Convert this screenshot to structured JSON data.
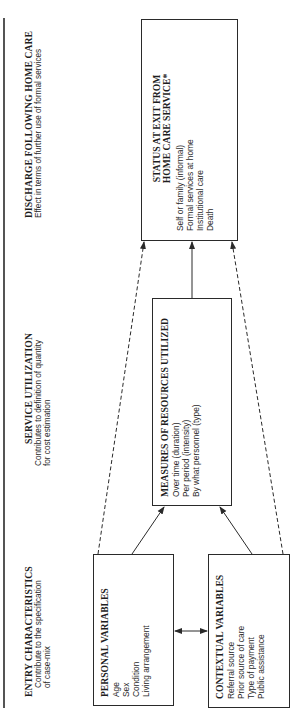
{
  "headers": {
    "entry": {
      "title": "ENTRY CHARACTERISTICS",
      "subtitle_lines": [
        "Contribute to the specification",
        "of case-mix"
      ]
    },
    "service": {
      "title": "SERVICE UTILIZATION",
      "subtitle_lines": [
        "Contributes to definition of quantity",
        "for cost estimation"
      ]
    },
    "discharge": {
      "title": "DISCHARGE FOLLOWING HOME CARE",
      "subtitle_lines": [
        "Effect in terms of further use of formal services"
      ]
    }
  },
  "boxes": {
    "personal": {
      "title": "PERSONAL VARIABLES",
      "items": [
        "Age",
        "Sex",
        "Condition",
        "Living arrangement"
      ]
    },
    "contextual": {
      "title": "CONTEXTUAL VARIABLES",
      "items": [
        "Referral source",
        "Prior source of care",
        "Type of payment",
        "Public assistance"
      ]
    },
    "measures": {
      "title": "MEASURES OF RESOURCES UTILIZED",
      "items": [
        "Over time (duration)",
        "Per period (intensity)",
        "By what personnel (type)"
      ]
    },
    "status": {
      "title_lines": [
        "STATUS AT EXIT FROM",
        "HOME CARE SERVICE*"
      ],
      "items": [
        "Self or family (informal)",
        "Formal services at home",
        "Institutional care",
        "Death"
      ]
    }
  },
  "connections": [
    {
      "from": "personal",
      "to": "measures",
      "style": "solid",
      "arrow": "end"
    },
    {
      "from": "contextual",
      "to": "measures",
      "style": "solid",
      "arrow": "end"
    },
    {
      "from": "measures",
      "to": "status",
      "style": "solid",
      "arrow": "end"
    },
    {
      "from": "personal",
      "to": "status",
      "style": "dashed",
      "arrow": "end"
    },
    {
      "from": "contextual",
      "to": "status",
      "style": "dashed",
      "arrow": "end"
    },
    {
      "from": "personal",
      "to": "contextual",
      "style": "solid",
      "arrow": "both"
    }
  ],
  "orientation": "rotated 90° counter-clockwise",
  "colors": {
    "ink": "#2a2a2a",
    "background": "#ffffff"
  }
}
